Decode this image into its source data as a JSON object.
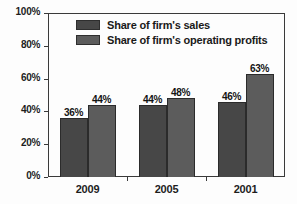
{
  "chart_data": {
    "type": "bar",
    "title": "",
    "xlabel": "",
    "ylabel": "",
    "categories": [
      "2009",
      "2005",
      "2001"
    ],
    "series": [
      {
        "name": "Share of firm's sales",
        "values": [
          36,
          44,
          46
        ],
        "labels": [
          "36%",
          "44%",
          "46%"
        ],
        "color": "#474747"
      },
      {
        "name": "Share of firm's operating profits",
        "values": [
          44,
          48,
          63
        ],
        "labels": [
          "44%",
          "48%",
          "63%"
        ],
        "color": "#5c5c5c"
      }
    ],
    "ylim": [
      0,
      100
    ],
    "ytick_labels": [
      "100%",
      "80%",
      "60%",
      "40%",
      "20%",
      "0%"
    ],
    "ytick_values": [
      100,
      80,
      60,
      40,
      20,
      0
    ],
    "grid": false,
    "legend_position": "top-inside",
    "value_labels_shown": true,
    "frame_color": "#3a3a3a",
    "background_color": "#fdfdfd"
  }
}
